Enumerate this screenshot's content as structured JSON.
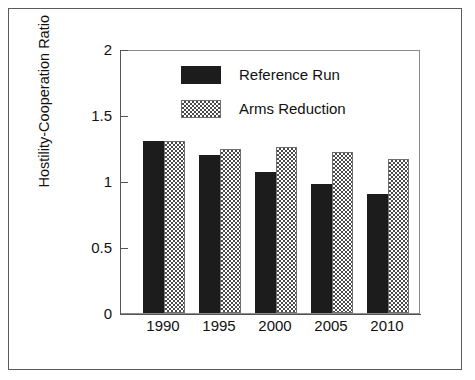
{
  "chart_data": {
    "type": "bar",
    "title": "",
    "xlabel": "",
    "ylabel": "Hostility-Cooperation Ratio",
    "categories": [
      "1990",
      "1995",
      "2000",
      "2005",
      "2010"
    ],
    "series": [
      {
        "name": "Reference Run",
        "fill": "solid-black",
        "color": "#1c1c1c",
        "values": [
          1.3,
          1.2,
          1.07,
          0.98,
          0.9
        ]
      },
      {
        "name": "Arms Reduction",
        "fill": "checkered-gray",
        "color": "#4a4a4a",
        "values": [
          1.3,
          1.24,
          1.26,
          1.22,
          1.17
        ]
      }
    ],
    "ylim": [
      0,
      2
    ],
    "yticks": [
      0,
      0.5,
      1,
      1.5,
      2
    ],
    "ytick_labels": [
      "0",
      "0.5",
      "1",
      "1.5",
      "2"
    ],
    "grid": false,
    "legend_position": "upper-center-left-inside"
  },
  "figure": {
    "background_color": "#ffffff",
    "frame_color": "#5a5a5a",
    "axis_color": "#555555"
  }
}
